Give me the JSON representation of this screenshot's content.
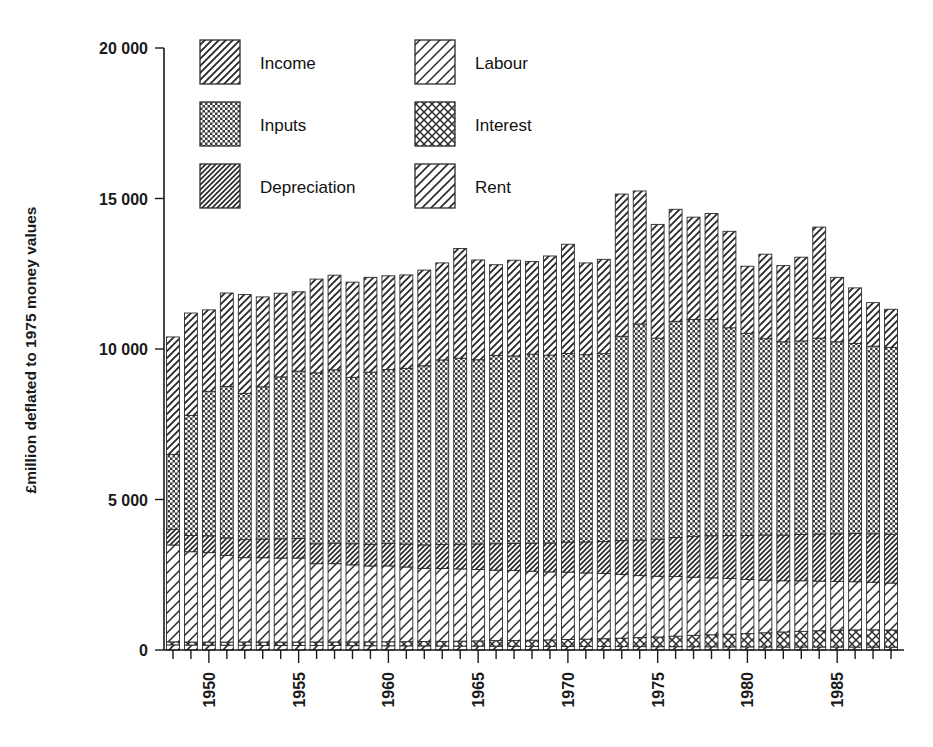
{
  "chart_data": {
    "type": "bar",
    "subtype": "stacked-vertical",
    "title": "",
    "xlabel": "",
    "ylabel": "£million deflated to 1975 money values",
    "ylim": [
      0,
      20000
    ],
    "ytick_labels": [
      "0",
      "5 000",
      "10 000",
      "15 000",
      "20 000"
    ],
    "ytick_values": [
      0,
      5000,
      10000,
      15000,
      20000
    ],
    "grid": false,
    "legend_position": "top-left-inside",
    "xtick_labels": [
      "1950",
      "1955",
      "1960",
      "1965",
      "1970",
      "1975",
      "1980",
      "1985"
    ],
    "xtick_values": [
      1950,
      1955,
      1960,
      1965,
      1970,
      1975,
      1980,
      1985
    ],
    "minor_xticks_every": 1,
    "x_range": [
      1948,
      1988
    ],
    "categories": [
      1948,
      1949,
      1950,
      1951,
      1952,
      1953,
      1954,
      1955,
      1956,
      1957,
      1958,
      1959,
      1960,
      1961,
      1962,
      1963,
      1964,
      1965,
      1966,
      1967,
      1968,
      1969,
      1970,
      1971,
      1972,
      1973,
      1974,
      1975,
      1976,
      1977,
      1978,
      1979,
      1980,
      1981,
      1982,
      1983,
      1984,
      1985,
      1986,
      1987,
      1988
    ],
    "stack_order_bottom_to_top": [
      "Rent",
      "Interest",
      "Labour",
      "Depreciation",
      "Inputs",
      "Income"
    ],
    "series": [
      {
        "name": "Rent",
        "pattern": "diagonal-hatch-sparse-left",
        "values": [
          170,
          165,
          160,
          160,
          158,
          155,
          152,
          150,
          150,
          148,
          145,
          142,
          140,
          138,
          135,
          132,
          130,
          128,
          126,
          124,
          122,
          120,
          118,
          116,
          115,
          113,
          112,
          110,
          110,
          108,
          106,
          105,
          104,
          102,
          100,
          100,
          100,
          100,
          98,
          96,
          95
        ]
      },
      {
        "name": "Interest",
        "pattern": "cross-hatch",
        "values": [
          100,
          100,
          105,
          105,
          110,
          110,
          112,
          115,
          118,
          120,
          125,
          130,
          135,
          140,
          148,
          155,
          165,
          175,
          185,
          195,
          205,
          215,
          230,
          245,
          260,
          280,
          300,
          320,
          350,
          380,
          400,
          420,
          440,
          470,
          500,
          520,
          540,
          560,
          570,
          575,
          570
        ]
      },
      {
        "name": "Labour",
        "pattern": "diagonal-hatch-wide-left",
        "values": [
          3220,
          3000,
          2970,
          2880,
          2800,
          2800,
          2790,
          2790,
          2600,
          2600,
          2560,
          2520,
          2520,
          2480,
          2430,
          2420,
          2400,
          2370,
          2340,
          2320,
          2290,
          2260,
          2240,
          2200,
          2170,
          2120,
          2060,
          2020,
          1980,
          1930,
          1890,
          1850,
          1800,
          1750,
          1700,
          1680,
          1650,
          1620,
          1600,
          1580,
          1560
        ]
      },
      {
        "name": "Depreciation",
        "pattern": "diagonal-hatch-dense-right",
        "values": [
          520,
          540,
          560,
          580,
          600,
          620,
          640,
          650,
          660,
          680,
          700,
          720,
          740,
          760,
          780,
          800,
          820,
          850,
          880,
          900,
          930,
          960,
          1000,
          1030,
          1060,
          1120,
          1180,
          1230,
          1300,
          1360,
          1400,
          1430,
          1460,
          1500,
          1520,
          1540,
          1560,
          1580,
          1600,
          1610,
          1620
        ]
      },
      {
        "name": "Inputs",
        "pattern": "checker-dark",
        "values": [
          2490,
          3990,
          4800,
          5030,
          4860,
          5060,
          5380,
          5560,
          5680,
          5760,
          5530,
          5720,
          5780,
          5840,
          5950,
          6130,
          6180,
          6120,
          6250,
          6230,
          6280,
          6240,
          6260,
          6220,
          6240,
          6790,
          7180,
          6680,
          7180,
          7200,
          7180,
          6900,
          6720,
          6520,
          6420,
          6430,
          6510,
          6380,
          6320,
          6230,
          6210
        ]
      },
      {
        "name": "Income",
        "pattern": "diagonal-hatch-medium-left",
        "values": [
          3900,
          3400,
          2705,
          3105,
          3280,
          2985,
          2778,
          2635,
          3114,
          3144,
          3160,
          3148,
          3117,
          3102,
          3179,
          3223,
          3645,
          3315,
          3019,
          3181,
          3083,
          3295,
          3632,
          3049,
          3135,
          4725,
          4418,
          3780,
          3722,
          3402,
          3524,
          3205,
          2226,
          2808,
          2530,
          2780,
          3690,
          2140,
          1842,
          1449,
          1265
        ]
      }
    ],
    "totals": [
      10400,
      11195,
      11300,
      11860,
      11808,
      11730,
      11852,
      11900,
      12322,
      12452,
      12215,
      12382,
      12432,
      12460,
      12622,
      12860,
      13340,
      12958,
      13000,
      13150,
      13110,
      13090,
      13480,
      12860,
      12980,
      15148,
      15250,
      14140,
      14642,
      14380,
      14500,
      13910,
      12750,
      13150,
      12770,
      13050,
      14050,
      12380,
      12030,
      11540,
      11320
    ]
  },
  "legend": {
    "items": [
      {
        "label": "Income",
        "pattern": "diagonal-hatch-medium-left"
      },
      {
        "label": "Labour",
        "pattern": "diagonal-hatch-wide-left"
      },
      {
        "label": "Inputs",
        "pattern": "checker-dark"
      },
      {
        "label": "Interest",
        "pattern": "cross-hatch"
      },
      {
        "label": "Depreciation",
        "pattern": "diagonal-hatch-dense-right"
      },
      {
        "label": "Rent",
        "pattern": "diagonal-hatch-sparse-left"
      }
    ]
  },
  "colors": {
    "ink": "#1a1a1a",
    "stroke": "#2b2b2b",
    "background": "#ffffff",
    "dark_fill": "#4a4a4a"
  }
}
